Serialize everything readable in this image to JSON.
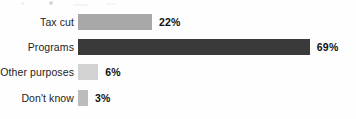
{
  "chart_data": {
    "type": "bar",
    "orientation": "horizontal",
    "title": "",
    "xlabel": "",
    "ylabel": "",
    "grid": false,
    "legend": "none",
    "xlim": [
      0,
      100
    ],
    "value_suffix": "%",
    "categories": [
      "Tax cut",
      "Programs",
      "Other purposes",
      "Don't know"
    ],
    "values": [
      22,
      69,
      6,
      3
    ],
    "value_labels": [
      "22%",
      "69%",
      "6%",
      "3%"
    ],
    "bar_colors": [
      "#a8a8a8",
      "#3a3a3a",
      "#d2d2d2",
      "#bcbcbc"
    ],
    "bars": [
      {
        "label": "Tax cut",
        "value": 22,
        "value_label": "22%",
        "color": "#a8a8a8"
      },
      {
        "label": "Programs",
        "value": 69,
        "value_label": "69%",
        "color": "#3a3a3a"
      },
      {
        "label": "Other purposes",
        "value": 6,
        "value_label": "6%",
        "color": "#d2d2d2"
      },
      {
        "label": "Don't know",
        "value": 3,
        "value_label": "3%",
        "color": "#bcbcbc"
      }
    ]
  },
  "layout": {
    "background": "#fefefe",
    "bar_origin_x": 78,
    "px_per_percent": 3.36,
    "row_tops": [
      12,
      37,
      62,
      88
    ],
    "bar_height": 16
  }
}
